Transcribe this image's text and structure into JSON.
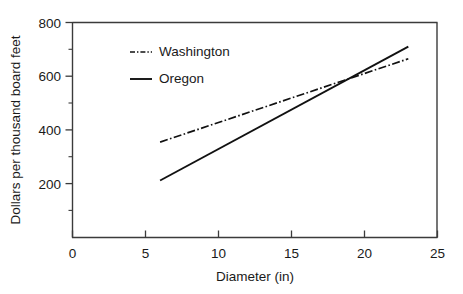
{
  "chart_data": {
    "type": "line",
    "title": "",
    "xlabel": "Diameter (in)",
    "ylabel": "Dollars per thousand board feet",
    "xlim": [
      0,
      25
    ],
    "ylim": [
      0,
      800
    ],
    "xticks": [
      0,
      5,
      10,
      15,
      20,
      25
    ],
    "yticks": [
      200,
      400,
      600,
      800
    ],
    "y_minor_ticks": [
      100,
      300,
      500,
      700
    ],
    "grid": false,
    "legend_position": "upper-left-inside",
    "series": [
      {
        "name": "Washington",
        "style": "dash-dot",
        "color": "#111111",
        "x": [
          6,
          23
        ],
        "values": [
          355,
          665
        ]
      },
      {
        "name": "Oregon",
        "style": "solid",
        "color": "#111111",
        "x": [
          6,
          23
        ],
        "values": [
          212,
          710
        ]
      }
    ],
    "annotations": []
  },
  "axes": {
    "x": {
      "label": "Diameter (in)",
      "tick_labels": [
        "0",
        "5",
        "10",
        "15",
        "20",
        "25"
      ]
    },
    "y": {
      "label": "Dollars per thousand board feet",
      "tick_labels": [
        "200",
        "400",
        "600",
        "800"
      ]
    }
  },
  "legend": {
    "items": [
      {
        "label": "Washington",
        "style": "dash-dot"
      },
      {
        "label": "Oregon",
        "style": "solid"
      }
    ]
  },
  "colors": {
    "background": "#ffffff",
    "axis": "#3b3b3b",
    "line": "#111111",
    "text": "#1a1a1a"
  }
}
